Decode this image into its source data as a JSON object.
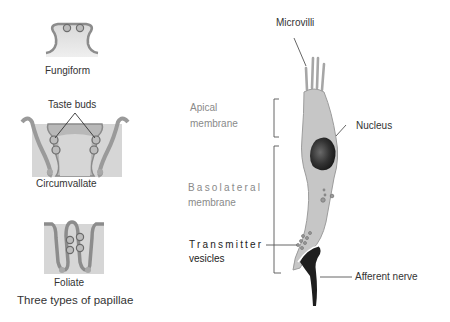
{
  "papillae": {
    "fungiform": {
      "label": "Fungiform"
    },
    "circumvallate": {
      "label": "Circumvallate",
      "callout": "Taste buds"
    },
    "foliate": {
      "label": "Foliate"
    },
    "caption": "Three types of papillae"
  },
  "taste_cell": {
    "microvilli": "Microvilli",
    "apical_membrane": [
      "Apical",
      "membrane"
    ],
    "nucleus": "Nucleus",
    "basolateral_membrane": [
      "Basolateral",
      "membrane"
    ],
    "transmitter_vesicles": [
      "Transmitter",
      "vesicles"
    ],
    "afferent_nerve": "Afferent nerve"
  },
  "colors": {
    "tissue_fill": "#d4d4d4",
    "tissue_outline": "#8c8c8c",
    "cell_fill": "#c6c6c6",
    "nucleus": "#2e2e2e",
    "nerve": "#1e1e1e",
    "leader_line": "#555555"
  }
}
